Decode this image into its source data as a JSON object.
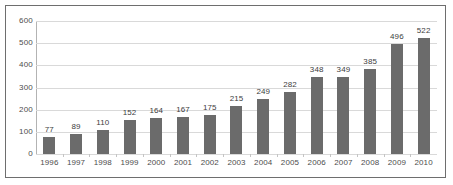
{
  "chart_data": {
    "type": "bar",
    "title": "",
    "subtitle": "",
    "xlabel": "",
    "ylabel": "",
    "categories": [
      "1996",
      "1997",
      "1998",
      "1999",
      "2000",
      "2001",
      "2002",
      "2003",
      "2004",
      "2005",
      "2006",
      "2007",
      "2008",
      "2009",
      "2010"
    ],
    "values": [
      77,
      89,
      110,
      152,
      164,
      167,
      175,
      215,
      249,
      282,
      348,
      349,
      385,
      496,
      522
    ],
    "data_labels": [
      "77",
      "89",
      "110",
      "152",
      "164",
      "167",
      "175",
      "215",
      "249",
      "282",
      "348",
      "349",
      "385",
      "496",
      "522"
    ],
    "ylim": [
      0,
      600
    ],
    "ytick_values": [
      0,
      100,
      200,
      300,
      400,
      500,
      600
    ],
    "ytick_labels": [
      "0",
      "100",
      "200",
      "300",
      "400",
      "500",
      "600"
    ],
    "grid": true,
    "grid_axis": "y",
    "legend": null,
    "legend_position": "none",
    "bar_color": "#6b6b6b",
    "gridline_color": "#d9d9d9",
    "axis_color": "#b3b3b3",
    "label_color": "#4d4d4d",
    "data_label_color": "#3d3d3d",
    "plot_background": "#ffffff",
    "border_color": "#6e6e6e"
  }
}
